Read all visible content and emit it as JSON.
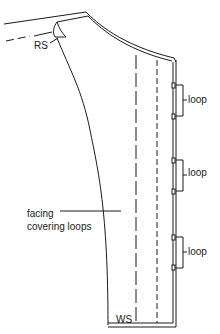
{
  "diagram": {
    "labels": {
      "rs": "RS",
      "ws": "WS",
      "facing_line1": "facing",
      "facing_line2": "covering loops",
      "loops": [
        "loop",
        "loop",
        "loop"
      ]
    },
    "colors": {
      "line": "#1a1a1a",
      "background": "#ffffff"
    }
  }
}
